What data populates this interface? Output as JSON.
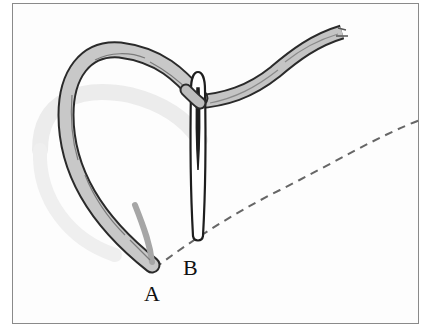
{
  "diagram": {
    "type": "sewing-stitch-illustration",
    "labels": {
      "a": "A",
      "b": "B"
    },
    "elements": [
      {
        "name": "thread",
        "description": "twisted thread looping from point A up and over through the needle eye, tail extending to upper right"
      },
      {
        "name": "needle",
        "description": "vertical sewing needle, eye at top, point at B"
      },
      {
        "name": "stitch-line",
        "description": "dashed seam line from A through B curving up to the right edge"
      }
    ],
    "colors": {
      "frame": "#8a8a8a",
      "outline": "#2a2a2a",
      "thread_fill": "#c4c4c4",
      "thread_shadow": "#9a9a9a",
      "dash": "#666666",
      "ghost": "#ececec"
    }
  }
}
